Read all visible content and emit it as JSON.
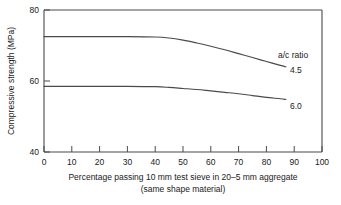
{
  "chart_data": {
    "type": "line",
    "title": "",
    "xlabel": "Percentage passing 10 mm test sieve in 20–5 mm aggregate (same shape material)",
    "xlabel_line1": "Percentage passing 10 mm test sieve in 20–5 mm aggregate",
    "xlabel_line2": "(same shape material)",
    "ylabel": "Compressive strength (MPa)",
    "xlim": [
      0,
      100
    ],
    "ylim": [
      40,
      80
    ],
    "xticks": [
      0,
      10,
      20,
      30,
      40,
      50,
      60,
      70,
      80,
      90,
      100
    ],
    "xtick_labels": [
      "0",
      "10",
      "20",
      "30",
      "40",
      "50",
      "60",
      "70",
      "80",
      "90",
      "100"
    ],
    "yticks": [
      40,
      60,
      80
    ],
    "ytick_labels": [
      "40",
      "60",
      "80"
    ],
    "grid": false,
    "legend_position": "inline-right",
    "legend_title": "a/c ratio",
    "series": [
      {
        "name": "4.5",
        "label": "4.5",
        "color": "#4a4a4a",
        "x": [
          0,
          10,
          20,
          30,
          40,
          45,
          50,
          55,
          60,
          65,
          70,
          75,
          80,
          85,
          87
        ],
        "values": [
          72.5,
          72.5,
          72.5,
          72.5,
          72.4,
          72.1,
          71.5,
          70.7,
          69.8,
          68.8,
          67.7,
          66.6,
          65.5,
          64.4,
          64.0
        ]
      },
      {
        "name": "6.0",
        "label": "6.0",
        "color": "#4a4a4a",
        "x": [
          0,
          10,
          20,
          30,
          40,
          45,
          50,
          55,
          60,
          65,
          70,
          75,
          80,
          85,
          87
        ],
        "values": [
          58.5,
          58.5,
          58.5,
          58.5,
          58.4,
          58.2,
          57.9,
          57.6,
          57.2,
          56.8,
          56.4,
          55.9,
          55.4,
          55.0,
          54.8
        ]
      }
    ],
    "annotations": [
      {
        "name": "legend-title",
        "text": "a/c ratio"
      },
      {
        "name": "series-label-4-5",
        "text": "4.5"
      },
      {
        "name": "series-label-6-0",
        "text": "6.0"
      }
    ]
  },
  "axes": {
    "y_label": "Compressive strength (MPa)",
    "y_tick_80": "80",
    "y_tick_60": "60",
    "y_tick_40": "40",
    "x_tick_0": "0",
    "x_tick_10": "10",
    "x_tick_20": "20",
    "x_tick_30": "30",
    "x_tick_40": "40",
    "x_tick_50": "50",
    "x_tick_60": "60",
    "x_tick_70": "70",
    "x_tick_80": "80",
    "x_tick_90": "90",
    "x_tick_100": "100",
    "x_label_line1": "Percentage passing 10 mm test sieve in 20–5 mm aggregate",
    "x_label_line2": "(same shape material)"
  },
  "labels": {
    "legend_title": "a/c ratio",
    "curve_high": "4.5",
    "curve_low": "6.0"
  },
  "colors": {
    "curve": "#4a4a4a",
    "axis": "#4a4a4a",
    "text": "#1a1a1a",
    "background": "#ffffff"
  }
}
